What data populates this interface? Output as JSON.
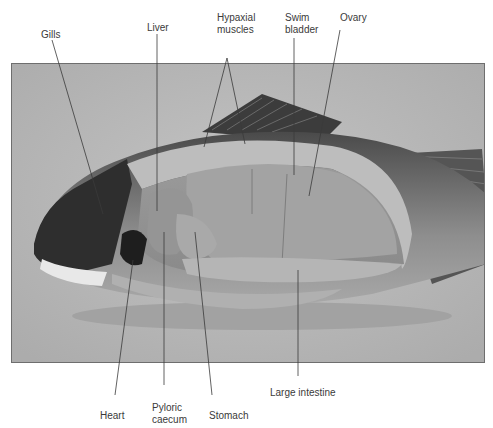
{
  "figure": {
    "labels_top": [
      {
        "id": "gills",
        "text": "Gills"
      },
      {
        "id": "liver",
        "text": "Liver"
      },
      {
        "id": "hypaxial-muscles",
        "text": "Hypaxial\nmuscles"
      },
      {
        "id": "swim-bladder",
        "text": "Swim\nbladder"
      },
      {
        "id": "ovary",
        "text": "Ovary"
      }
    ],
    "labels_bottom": [
      {
        "id": "heart",
        "text": "Heart"
      },
      {
        "id": "pyloric-caecum",
        "text": "Pyloric\ncaecum"
      },
      {
        "id": "stomach",
        "text": "Stomach"
      },
      {
        "id": "large-intestine",
        "text": "Large intestine"
      }
    ]
  },
  "colors": {
    "background": "#ffffff",
    "photo_background": "#b9b9b9",
    "frame": "#6e6e6e",
    "leader_line": "#3a3a3a",
    "label_text": "#3a3a3a"
  }
}
